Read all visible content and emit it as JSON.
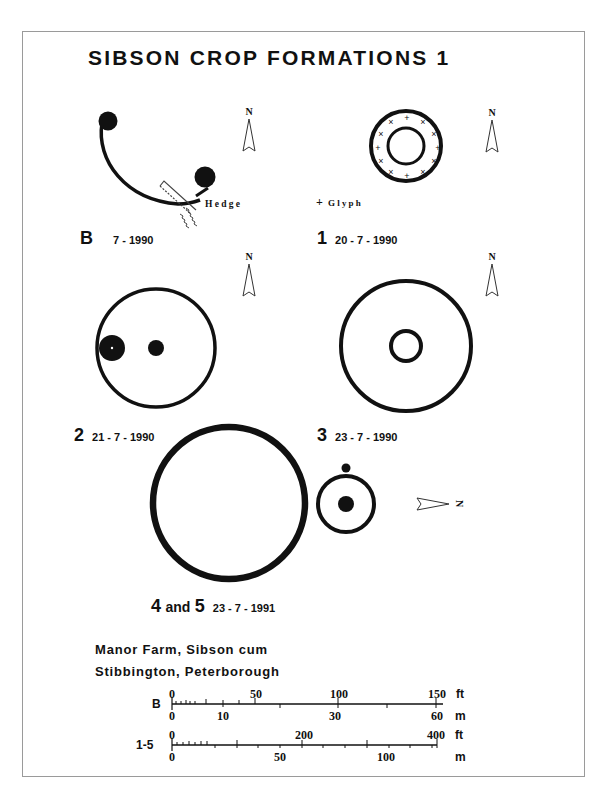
{
  "title": "SIBSON CROP FORMATIONS 1",
  "formations": [
    {
      "id": "B",
      "number": "B",
      "date": "7 - 1990",
      "annotations": [
        "Hedge"
      ],
      "north": "N"
    },
    {
      "id": "1",
      "number": "1",
      "date": "20 - 7 - 1990",
      "annotations": [
        "Glyph"
      ],
      "legend_symbol": "+",
      "north": "N"
    },
    {
      "id": "2",
      "number": "2",
      "date": "21 - 7 - 1990",
      "north": "N"
    },
    {
      "id": "3",
      "number": "3",
      "date": "23 - 7 - 1990",
      "north": "N"
    },
    {
      "id": "4-5",
      "number_a": "4",
      "joiner": "and",
      "number_b": "5",
      "date": "23 - 7 - 1991",
      "north": "N"
    }
  ],
  "location": {
    "line1": "Manor Farm, Sibson cum",
    "line2": "Stibbington, Peterborough"
  },
  "scales": [
    {
      "label": "B",
      "ft_ticks": [
        "0",
        "50",
        "100",
        "150"
      ],
      "ft_unit": "ft",
      "m_ticks": [
        "0",
        "10",
        "30",
        "60"
      ],
      "m_unit": "m"
    },
    {
      "label": "1-5",
      "ft_ticks": [
        "0",
        "200",
        "400"
      ],
      "ft_unit": "ft",
      "m_ticks": [
        "0",
        "50",
        "100"
      ],
      "m_unit": "m"
    }
  ],
  "colors": {
    "ink": "#111111",
    "paper": "#ffffff",
    "frame": "#9a9a9a"
  }
}
